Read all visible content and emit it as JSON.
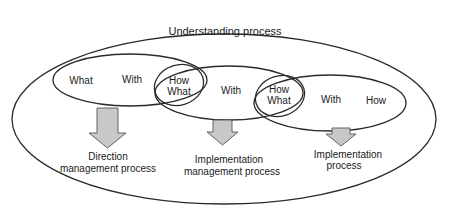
{
  "diagram": {
    "outer": {
      "label": "Understanding process"
    },
    "ellipses": [
      {
        "id": "left",
        "labels": [
          "What",
          "With"
        ]
      },
      {
        "id": "middle",
        "labels": [
          "With"
        ]
      },
      {
        "id": "right",
        "labels": [
          "With",
          "How"
        ]
      }
    ],
    "overlaps": [
      {
        "id": "left-middle",
        "line1": "How",
        "line2": "What"
      },
      {
        "id": "middle-right",
        "line1": "How",
        "line2": "What"
      }
    ],
    "outputs": [
      {
        "line1": "Direction",
        "line2": "management process"
      },
      {
        "line1": "Implementation",
        "line2": "management process"
      },
      {
        "line1": "Implementation",
        "line2": "process"
      }
    ]
  },
  "colors": {
    "stroke": "#2a2a2a",
    "arrow_fill": "#c8c8c8",
    "arrow_stroke": "#555555",
    "background": "#ffffff"
  }
}
